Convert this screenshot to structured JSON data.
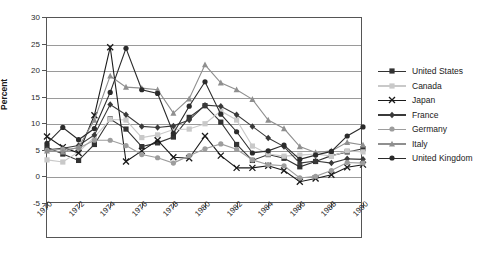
{
  "chart": {
    "type": "line",
    "ylabel": "Percent",
    "ytick_labels": [
      "30",
      "25",
      "20",
      "15",
      "10",
      "5",
      "0",
      "-5"
    ],
    "xtick_labels": [
      "1970",
      "1972",
      "1974",
      "1976",
      "1978",
      "1980",
      "1982",
      "1984",
      "1986",
      "1988",
      "1990"
    ]
  },
  "legend": {
    "items": [
      {
        "label": "United States",
        "color": "#333333",
        "marker": "square"
      },
      {
        "label": "Canada",
        "color": "#c9c9c9",
        "marker": "square"
      },
      {
        "label": "Japan",
        "color": "#1a1a1a",
        "marker": "x"
      },
      {
        "label": "France",
        "color": "#3a3a3a",
        "marker": "diamond"
      },
      {
        "label": "Germany",
        "color": "#9d9d9d",
        "marker": "circle"
      },
      {
        "label": "Italy",
        "color": "#8f8f8f",
        "marker": "triangle"
      },
      {
        "label": "United Kingdom",
        "color": "#2b2b2b",
        "marker": "circle"
      }
    ]
  },
  "chart_data": {
    "type": "line",
    "title": "",
    "xlabel": "",
    "ylabel": "Percent",
    "xlim": [
      1970,
      1990
    ],
    "ylim": [
      -5,
      30
    ],
    "ytick_values": [
      30,
      25,
      20,
      15,
      10,
      5,
      0,
      -5
    ],
    "xtick_values": [
      1970,
      1972,
      1974,
      1976,
      1978,
      1980,
      1982,
      1984,
      1986,
      1988,
      1990
    ],
    "grid": true,
    "legend_position": "right",
    "x": [
      1970,
      1971,
      1972,
      1973,
      1974,
      1975,
      1976,
      1977,
      1978,
      1979,
      1980,
      1981,
      1982,
      1983,
      1984,
      1985,
      1986,
      1987,
      1988,
      1989,
      1990
    ],
    "series": [
      {
        "name": "United States",
        "color": "#333333",
        "marker": "square",
        "values": [
          5.7,
          4.4,
          3.2,
          6.2,
          11.0,
          9.1,
          5.8,
          6.5,
          7.6,
          11.3,
          13.5,
          10.4,
          6.2,
          3.2,
          4.3,
          3.6,
          2.0,
          3.0,
          4.1,
          4.8,
          5.4
        ]
      },
      {
        "name": "Canada",
        "color": "#c9c9c9",
        "marker": "square",
        "values": [
          3.3,
          2.9,
          4.8,
          7.6,
          10.9,
          10.8,
          7.5,
          8.0,
          9.0,
          9.1,
          10.1,
          12.5,
          10.8,
          5.9,
          4.4,
          4.0,
          4.2,
          4.4,
          4.0,
          5.0,
          4.8
        ]
      },
      {
        "name": "Japan",
        "color": "#1a1a1a",
        "marker": "x",
        "values": [
          7.7,
          5.7,
          4.6,
          11.7,
          24.5,
          3.0,
          5.0,
          7.0,
          3.8,
          3.6,
          7.8,
          4.1,
          1.8,
          1.8,
          2.2,
          1.3,
          -0.8,
          -0.2,
          0.5,
          1.9,
          2.4
        ]
      },
      {
        "name": "France",
        "color": "#3a3a3a",
        "marker": "diamond",
        "values": [
          5.2,
          5.5,
          6.0,
          8.0,
          13.7,
          11.8,
          9.6,
          9.4,
          9.7,
          10.8,
          13.6,
          13.4,
          11.8,
          9.6,
          7.4,
          5.8,
          2.7,
          3.1,
          2.7,
          3.5,
          3.4
        ]
      },
      {
        "name": "Germany",
        "color": "#9d9d9d",
        "marker": "circle",
        "values": [
          5.1,
          5.3,
          5.5,
          7.0,
          7.0,
          6.0,
          4.3,
          3.7,
          2.7,
          4.1,
          5.4,
          6.3,
          5.3,
          3.3,
          2.4,
          2.2,
          -0.1,
          0.2,
          1.3,
          2.8,
          2.7
        ]
      },
      {
        "name": "Italy",
        "color": "#8f8f8f",
        "marker": "triangle",
        "values": [
          5.0,
          4.8,
          5.7,
          10.8,
          19.1,
          17.0,
          16.8,
          16.5,
          12.1,
          14.8,
          21.2,
          17.8,
          16.5,
          14.7,
          10.8,
          9.2,
          5.8,
          4.7,
          5.0,
          6.6,
          6.1
        ]
      },
      {
        "name": "United Kingdom",
        "color": "#2b2b2b",
        "marker": "circle",
        "values": [
          6.4,
          9.4,
          7.1,
          9.2,
          16.0,
          24.3,
          16.5,
          15.8,
          8.3,
          13.4,
          18.0,
          11.9,
          8.6,
          4.6,
          5.0,
          6.1,
          3.4,
          4.2,
          4.9,
          7.8,
          9.5
        ]
      }
    ]
  }
}
